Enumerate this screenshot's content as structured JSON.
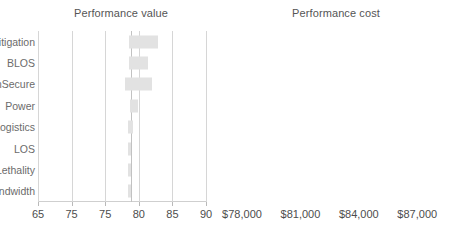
{
  "chart_data": [
    {
      "type": "bar",
      "orientation": "horizontal",
      "style": "tornado",
      "title": "Performance value",
      "xlabel": "",
      "ylabel": "",
      "xlim": [
        65,
        90
      ],
      "grid": true,
      "legend": null,
      "bar_color": "#e2e2e2",
      "baseline": 78.9,
      "tick_labels": [
        "65",
        "75",
        "75",
        "80",
        "85",
        "90"
      ],
      "tick_values": [
        65,
        70,
        75,
        80,
        85,
        90
      ],
      "categories": [
        "LethalMitigation",
        "BLOS",
        "CommSecure",
        "Power",
        "Logistics",
        "LOS",
        "Lethality",
        "Bandwidth"
      ],
      "low": [
        78.5,
        78.6,
        77.9,
        78.7,
        78.4,
        78.4,
        78.4,
        78.4
      ],
      "high": [
        82.9,
        81.4,
        82.0,
        79.9,
        79.1,
        78.9,
        78.8,
        78.8
      ]
    },
    {
      "type": "bar",
      "orientation": "horizontal",
      "style": "tornado",
      "title": "Performance cost",
      "xlabel": "",
      "ylabel": "",
      "xlim": [
        78000,
        87500
      ],
      "grid": true,
      "legend": null,
      "bar_color": "#a8a8a8",
      "baseline": 84000,
      "tick_labels": [
        "$78,000",
        "$81,000",
        "$84,000",
        "$87,000"
      ],
      "tick_values": [
        78000,
        81000,
        84000,
        87000
      ],
      "categories": [
        "Lenses",
        "Display",
        "InternalComm",
        "ExternalComm"
      ],
      "low": [
        82600,
        83500,
        83700,
        83900
      ],
      "high": [
        86000,
        84400,
        84400,
        84050
      ]
    }
  ],
  "panels": {
    "value": {
      "title": "Performance value",
      "categories": [
        {
          "label": "LethalMitigation"
        },
        {
          "label": "BLOS"
        },
        {
          "label": "CommSecure"
        },
        {
          "label": "Power"
        },
        {
          "label": "Logistics"
        },
        {
          "label": "LOS"
        },
        {
          "label": "Lethality"
        },
        {
          "label": "Bandwidth"
        }
      ],
      "ticks": [
        {
          "label": "65"
        },
        {
          "label": "75"
        },
        {
          "label": "75"
        },
        {
          "label": "80"
        },
        {
          "label": "85"
        },
        {
          "label": "90"
        }
      ]
    },
    "cost": {
      "title": "Performance cost",
      "categories": [
        {
          "label": "Lenses"
        },
        {
          "label": "Display"
        },
        {
          "label": "InternalComm"
        },
        {
          "label": "ExternalComm"
        }
      ],
      "ticks": [
        {
          "label": "$78,000"
        },
        {
          "label": "$81,000"
        },
        {
          "label": "$84,000"
        },
        {
          "label": "$87,000"
        }
      ]
    }
  }
}
